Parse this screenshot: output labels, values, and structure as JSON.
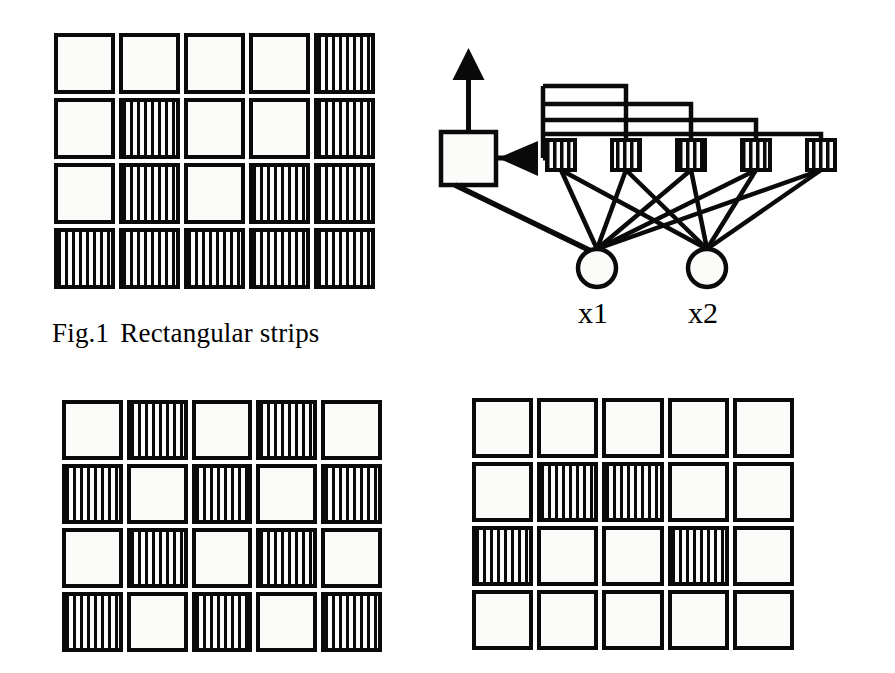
{
  "figure": {
    "caption_number": "Fig.1",
    "caption_text": "Rectangular strips"
  },
  "palette": {
    "ink": "#0a0a0a",
    "paper": "#fbfbf9",
    "background": "#ffffff"
  },
  "grids": {
    "top_left": {
      "name": "rectangular-strips-pattern-a",
      "rows": 4,
      "cols": 5,
      "legend": {
        "0": "plain",
        "1": "striped"
      },
      "cells": [
        [
          0,
          0,
          0,
          0,
          1
        ],
        [
          0,
          1,
          0,
          0,
          1
        ],
        [
          0,
          1,
          0,
          1,
          1
        ],
        [
          1,
          1,
          1,
          1,
          1
        ]
      ]
    },
    "bottom_left": {
      "name": "rectangular-strips-pattern-b",
      "rows": 4,
      "cols": 5,
      "legend": {
        "0": "plain",
        "1": "striped"
      },
      "cells": [
        [
          0,
          1,
          0,
          1,
          0
        ],
        [
          1,
          0,
          1,
          0,
          1
        ],
        [
          0,
          1,
          0,
          1,
          0
        ],
        [
          1,
          0,
          1,
          0,
          1
        ]
      ]
    },
    "bottom_right": {
      "name": "rectangular-strips-pattern-c",
      "rows": 4,
      "cols": 5,
      "legend": {
        "0": "plain",
        "1": "striped"
      },
      "cells": [
        [
          0,
          0,
          0,
          0,
          0
        ],
        [
          0,
          1,
          1,
          0,
          0
        ],
        [
          1,
          0,
          0,
          1,
          0
        ],
        [
          0,
          0,
          0,
          0,
          0
        ]
      ]
    }
  },
  "network": {
    "input_labels": [
      "x1",
      "x2"
    ],
    "input_nodes": [
      {
        "label": "x1",
        "cx": 177,
        "cy": 228,
        "r": 19
      },
      {
        "label": "x2",
        "cx": 287,
        "cy": 228,
        "r": 19
      }
    ],
    "hidden_units_count": 5,
    "hidden_units": [
      {
        "cx": 141,
        "cy": 115
      },
      {
        "cx": 206,
        "cy": 115
      },
      {
        "cx": 271,
        "cy": 115
      },
      {
        "cx": 336,
        "cy": 115
      },
      {
        "cx": 401,
        "cy": 115
      }
    ],
    "output_node": {
      "x": 21,
      "y": 92,
      "w": 55,
      "h": 53,
      "shape": "square"
    },
    "output_arrow_direction": "up",
    "input_arrow_direction": "left",
    "feedback_bus_lines": 4,
    "connections": "each hidden unit connects to both input nodes"
  }
}
